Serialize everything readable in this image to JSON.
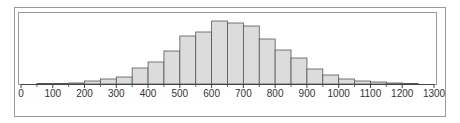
{
  "chart_data": {
    "type": "bar",
    "subtype": "histogram",
    "title": "",
    "xlabel": "",
    "ylabel": "",
    "bin_width": 50,
    "bins_start": [
      50,
      100,
      150,
      200,
      250,
      300,
      350,
      400,
      450,
      500,
      550,
      600,
      650,
      700,
      750,
      800,
      850,
      900,
      950,
      1000,
      1050,
      1100,
      1150,
      1200
    ],
    "values": [
      0.5,
      0.5,
      1,
      3,
      5,
      7,
      16,
      22,
      33,
      48,
      52,
      63,
      61,
      58,
      45,
      34,
      26,
      15,
      9,
      5,
      3,
      2,
      1,
      0.5
    ],
    "xlim": [
      0,
      1300
    ],
    "xticks": [
      0,
      100,
      200,
      300,
      400,
      500,
      600,
      700,
      800,
      900,
      1000,
      1100,
      1200,
      1300
    ],
    "xtick_labels": [
      "0",
      "100",
      "200",
      "300",
      "400",
      "500",
      "600",
      "700",
      "800",
      "900",
      "1000",
      "1100",
      "1200",
      "1300"
    ],
    "y_axis_shown": false,
    "grid": false,
    "legend": null,
    "colors": {
      "bar_fill": "#dcdcdc",
      "bar_edge": "#555555",
      "frame": "#9a9a9a",
      "axis": "#444444"
    }
  }
}
